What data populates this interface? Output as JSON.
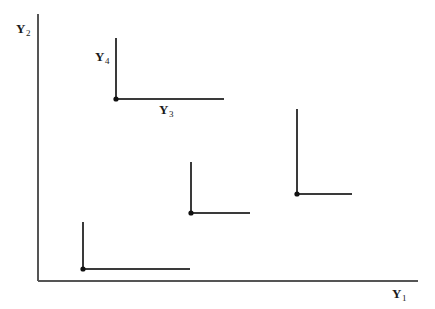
{
  "figure": {
    "background_color": "#ffffff",
    "line_color": "#3a3a3a",
    "axis_color": "#555555",
    "marker_color": "#111111",
    "axis_labels": {
      "y_axis": {
        "base": "Y",
        "subscript": "2",
        "full": "Y2"
      },
      "x_axis": {
        "base": "Y",
        "subscript": "1",
        "full": "Y1"
      },
      "vertical_arm": {
        "base": "Y",
        "subscript": "4",
        "full": "Y4"
      },
      "horizontal_arm": {
        "base": "Y",
        "subscript": "3",
        "full": "Y3"
      }
    }
  },
  "chart_data": {
    "type": "scatter",
    "title": "",
    "xlabel": "Y1",
    "ylabel": "Y2",
    "grid": false,
    "legend": null,
    "annotations": [
      {
        "text": "Y4",
        "x_px": 102,
        "y_px": 59,
        "describes": "vertical arm length of marker"
      },
      {
        "text": "Y3",
        "x_px": 170,
        "y_px": 111,
        "describes": "horizontal arm length of marker"
      }
    ],
    "axes_px": {
      "y_axis": {
        "x": 38,
        "y_top": 14,
        "y_bottom": 281
      },
      "x_axis": {
        "y": 281,
        "x_left": 38,
        "x_right": 418
      }
    },
    "marker_style": "L-shaped: dot at (x,y) with vertical arm upward and horizontal arm rightward",
    "points": [
      {
        "id": "point-1",
        "x_px": 116,
        "y_px": 99,
        "vertical_arm_top_px": 38,
        "vertical_arm_length_px": 61,
        "horizontal_arm_end_px": 224,
        "horizontal_arm_length_px": 108,
        "labeled": true
      },
      {
        "id": "point-2",
        "x_px": 191,
        "y_px": 213,
        "vertical_arm_top_px": 162,
        "vertical_arm_length_px": 51,
        "horizontal_arm_end_px": 250,
        "horizontal_arm_length_px": 59,
        "labeled": false
      },
      {
        "id": "point-3",
        "x_px": 297,
        "y_px": 194,
        "vertical_arm_top_px": 109,
        "vertical_arm_length_px": 85,
        "horizontal_arm_end_px": 352,
        "horizontal_arm_length_px": 55,
        "labeled": false
      },
      {
        "id": "point-4",
        "x_px": 83,
        "y_px": 269,
        "vertical_arm_top_px": 222,
        "vertical_arm_length_px": 47,
        "horizontal_arm_end_px": 190,
        "horizontal_arm_length_px": 107,
        "labeled": false
      }
    ]
  }
}
